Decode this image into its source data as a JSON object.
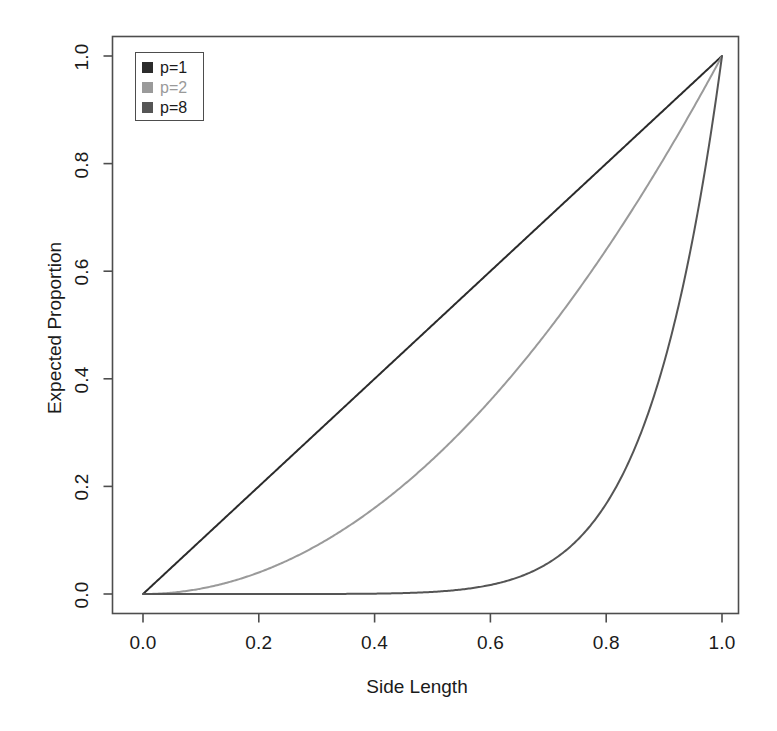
{
  "chart_data": {
    "type": "line",
    "title": "",
    "xlabel": "Side Length",
    "ylabel": "Expected Proportion",
    "xlim": [
      0.0,
      1.0
    ],
    "ylim": [
      0.0,
      1.0
    ],
    "grid": false,
    "legend_position": "top-left",
    "xticks": [
      "0.0",
      "0.2",
      "0.4",
      "0.6",
      "0.8",
      "1.0"
    ],
    "yticks": [
      "0.0",
      "0.2",
      "0.4",
      "0.6",
      "0.8",
      "1.0"
    ],
    "xtick_values": [
      0.0,
      0.2,
      0.4,
      0.6,
      0.8,
      1.0
    ],
    "ytick_values": [
      0.0,
      0.2,
      0.4,
      0.6,
      0.8,
      1.0
    ],
    "x": [
      0.0,
      0.05,
      0.1,
      0.15,
      0.2,
      0.25,
      0.3,
      0.35,
      0.4,
      0.45,
      0.5,
      0.55,
      0.6,
      0.65,
      0.7,
      0.75,
      0.8,
      0.85,
      0.9,
      0.95,
      1.0
    ],
    "series": [
      {
        "name": "p=1",
        "exponent": 1,
        "color": "#2b2b2b",
        "values": [
          0.0,
          0.05,
          0.1,
          0.15,
          0.2,
          0.25,
          0.3,
          0.35,
          0.4,
          0.45,
          0.5,
          0.55,
          0.6,
          0.65,
          0.7,
          0.75,
          0.8,
          0.85,
          0.9,
          0.95,
          1.0
        ]
      },
      {
        "name": "p=2",
        "exponent": 2,
        "color": "#9a9a9a",
        "values": [
          0.0,
          0.0025,
          0.01,
          0.0225,
          0.04,
          0.0625,
          0.09,
          0.1225,
          0.16,
          0.2025,
          0.25,
          0.3025,
          0.36,
          0.4225,
          0.49,
          0.5625,
          0.64,
          0.7225,
          0.81,
          0.9025,
          1.0
        ]
      },
      {
        "name": "p=8",
        "exponent": 8,
        "color": "#555555",
        "values": [
          0.0,
          0.0,
          0.0,
          0.0,
          0.0,
          0.0,
          0.0001,
          0.0002,
          0.0007,
          0.0017,
          0.0039,
          0.0084,
          0.0168,
          0.0319,
          0.0576,
          0.1001,
          0.1678,
          0.2725,
          0.4305,
          0.6634,
          1.0
        ]
      }
    ],
    "legend": [
      {
        "label": "p=1",
        "color": "#2b2b2b"
      },
      {
        "label": "p=2",
        "color": "#9a9a9a"
      },
      {
        "label": "p=8",
        "color": "#555555"
      }
    ]
  },
  "axes": {
    "x_title": "Side Length",
    "y_title": "Expected Proportion",
    "x_tick_0": "0.0",
    "x_tick_1": "0.2",
    "x_tick_2": "0.4",
    "x_tick_3": "0.6",
    "x_tick_4": "0.8",
    "x_tick_5": "1.0",
    "y_tick_0": "0.0",
    "y_tick_1": "0.2",
    "y_tick_2": "0.4",
    "y_tick_3": "0.6",
    "y_tick_4": "0.8",
    "y_tick_5": "1.0"
  },
  "legend_labels": {
    "item_0": "p=1",
    "item_1": "p=2",
    "item_2": "p=8"
  },
  "colors": {
    "axis": "#4d4d4d",
    "text": "#1a1a1a",
    "background": "#ffffff",
    "series_p1": "#2b2b2b",
    "series_p2": "#9a9a9a",
    "series_p8": "#555555"
  }
}
